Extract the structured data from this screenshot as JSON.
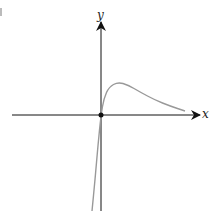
{
  "chart_data": {
    "type": "line",
    "title": "",
    "xlabel": "x",
    "ylabel": "y",
    "grid": false,
    "legend": null,
    "annotations": [
      "point at origin"
    ],
    "series": [
      {
        "name": "curve",
        "color": "#999999",
        "points_px": [
          [
            92,
            211
          ],
          [
            95,
            180
          ],
          [
            98,
            145
          ],
          [
            101,
            115
          ],
          [
            104,
            98
          ],
          [
            109,
            87
          ],
          [
            118,
            82
          ],
          [
            128,
            85
          ],
          [
            140,
            92
          ],
          [
            155,
            100
          ],
          [
            170,
            106
          ],
          [
            185,
            111
          ]
        ]
      }
    ],
    "origin_point": {
      "x": 0,
      "y": 0
    }
  },
  "labels": {
    "x_axis": "x",
    "y_axis": "y"
  },
  "colors": {
    "axis": "#111111",
    "curve": "#999999",
    "point": "#111111"
  }
}
